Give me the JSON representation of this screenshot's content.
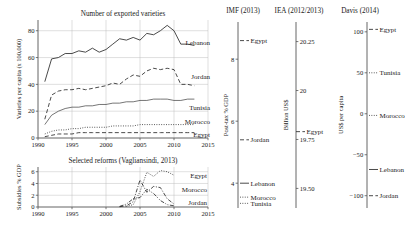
{
  "figure": {
    "panels_header": [
      "IMF (2013)",
      "IEA (2012/2013)",
      "Davis (2014)"
    ]
  },
  "chart_data": [
    {
      "id": "exported-varieties",
      "type": "line",
      "title": "Number of exported varieties",
      "xlabel": "",
      "ylabel": "Varieties per capita (x 100,000)",
      "xlim": [
        1990,
        2015
      ],
      "ylim": [
        0,
        88
      ],
      "xticks": [
        1990,
        1995,
        2000,
        2005,
        2010,
        2015
      ],
      "yticks": [
        0,
        20,
        40,
        60,
        80
      ],
      "grid": true,
      "legend_position": "right-inline",
      "series": [
        {
          "name": "Lebanon",
          "style": "solid",
          "x": [
            1991,
            1992,
            1993,
            1994,
            1995,
            1996,
            1997,
            1998,
            1999,
            2000,
            2001,
            2002,
            2003,
            2004,
            2005,
            2006,
            2007,
            2008,
            2009,
            2010,
            2011,
            2012,
            2013
          ],
          "values": [
            42,
            59,
            60,
            63,
            63,
            65,
            64,
            67,
            64,
            66,
            70,
            74,
            73,
            75,
            73,
            78,
            77,
            80,
            84,
            80,
            70,
            70,
            69
          ]
        },
        {
          "name": "Jordan",
          "style": "dashed",
          "x": [
            1991,
            1992,
            1993,
            1994,
            1995,
            1996,
            1997,
            1998,
            1999,
            2000,
            2001,
            2002,
            2003,
            2004,
            2005,
            2006,
            2007,
            2008,
            2009,
            2010,
            2011,
            2012,
            2013
          ],
          "values": [
            14,
            32,
            35,
            36,
            36,
            37,
            36,
            37,
            38,
            39,
            41,
            40,
            44,
            47,
            46,
            50,
            52,
            51,
            52,
            51,
            40,
            40,
            39
          ]
        },
        {
          "name": "Tunisia",
          "style": "thin-solid",
          "x": [
            1991,
            1992,
            1993,
            1994,
            1995,
            1996,
            1997,
            1998,
            1999,
            2000,
            2001,
            2002,
            2003,
            2004,
            2005,
            2006,
            2007,
            2008,
            2009,
            2010,
            2011,
            2012,
            2013
          ],
          "values": [
            10,
            17,
            20,
            22,
            23,
            23,
            24,
            24,
            25,
            25,
            26,
            26,
            27,
            27,
            28,
            28,
            29,
            29,
            29,
            28,
            28,
            29,
            29
          ]
        },
        {
          "name": "Morocco",
          "style": "dotted",
          "x": [
            1991,
            1992,
            1993,
            1994,
            1995,
            1996,
            1997,
            1998,
            1999,
            2000,
            2001,
            2002,
            2003,
            2004,
            2005,
            2006,
            2007,
            2008,
            2009,
            2010,
            2011,
            2012,
            2013
          ],
          "values": [
            3,
            5,
            6,
            6,
            7,
            7,
            8,
            8,
            8,
            8,
            9,
            9,
            9,
            9,
            10,
            10,
            10,
            10,
            10,
            10,
            10,
            10,
            10
          ]
        },
        {
          "name": "Egypt",
          "style": "dashed",
          "x": [
            1991,
            1992,
            1993,
            1994,
            1995,
            1996,
            1997,
            1998,
            1999,
            2000,
            2001,
            2002,
            2003,
            2004,
            2005,
            2006,
            2007,
            2008,
            2009,
            2010,
            2011,
            2012,
            2013
          ],
          "values": [
            1,
            2,
            3,
            3,
            3,
            4,
            4,
            4,
            4,
            4,
            4,
            4,
            4,
            4,
            4,
            4,
            4,
            4,
            4,
            4,
            4,
            4,
            4
          ]
        }
      ]
    },
    {
      "id": "selected-reforms",
      "type": "line",
      "title": "Selected reforms (Vagliansindi, 2013)",
      "xlabel": "",
      "ylabel": "Subsidies % GDP",
      "xlim": [
        1990,
        2015
      ],
      "ylim": [
        0,
        6.8
      ],
      "xticks": [
        1990,
        1995,
        2000,
        2005,
        2010,
        2015
      ],
      "yticks": [
        0,
        2,
        4,
        6
      ],
      "grid": true,
      "legend_position": "right-inline",
      "series": [
        {
          "name": "Egypt",
          "style": "dotted",
          "x": [
            2003,
            2004,
            2005,
            2006,
            2007,
            2008,
            2009,
            2010
          ],
          "values": [
            0.1,
            0.4,
            2.6,
            5.9,
            5.2,
            6.2,
            6.0,
            5.4
          ]
        },
        {
          "name": "Morocco",
          "style": "dash-dot",
          "x": [
            2002,
            2003,
            2004,
            2005,
            2006,
            2007,
            2008,
            2009,
            2010
          ],
          "values": [
            0.05,
            0.2,
            0.9,
            4.6,
            2.5,
            3.5,
            3.3,
            1.4,
            0.5
          ]
        },
        {
          "name": "Jordan",
          "style": "dash-dot-dot",
          "x": [
            2002,
            2003,
            2004,
            2005,
            2006,
            2007,
            2008,
            2009,
            2010
          ],
          "values": [
            0.1,
            0.5,
            1.4,
            1.6,
            3.0,
            2.3,
            1.1,
            0.4,
            0.2
          ]
        }
      ]
    },
    {
      "id": "imf-2013",
      "type": "scatter",
      "title": "IMF (2013)",
      "ylabel": "Post-tax % GDP",
      "ylim": [
        3.2,
        9.2
      ],
      "yticks": [
        4,
        6,
        8
      ],
      "points": [
        {
          "name": "Egypt",
          "value": 8.6,
          "style": "dashed"
        },
        {
          "name": "Jordan",
          "value": 5.4,
          "style": "dashed"
        },
        {
          "name": "Lebanon",
          "value": 4.0,
          "style": "solid"
        },
        {
          "name": "Morocco",
          "value": 3.55,
          "style": "dotted"
        },
        {
          "name": "Tunisia",
          "value": 3.35,
          "style": "dotted"
        }
      ]
    },
    {
      "id": "iea-2012-2013",
      "type": "scatter",
      "title": "IEA (2012/2013)",
      "ylabel": "Billion US$",
      "ylim": [
        19.4,
        20.35
      ],
      "yticks": [
        19.5,
        19.75,
        20.0,
        20.25
      ],
      "points": [
        {
          "name": "Egypt",
          "value": 19.79,
          "style": "dashed"
        }
      ]
    },
    {
      "id": "davis-2014",
      "type": "scatter",
      "title": "Davis (2014)",
      "ylabel": "US$ per capita",
      "ylim": [
        -115,
        112
      ],
      "yticks": [
        100,
        50,
        0,
        -50,
        -100
      ],
      "points": [
        {
          "name": "Egypt",
          "value": 103,
          "style": "dashed"
        },
        {
          "name": "Tunisia",
          "value": 50,
          "style": "dotted"
        },
        {
          "name": "Morocco",
          "value": -2,
          "style": "dotted"
        },
        {
          "name": "Lebanon",
          "value": -68,
          "style": "solid"
        },
        {
          "name": "Jordan",
          "value": -100,
          "style": "dashed"
        }
      ]
    }
  ]
}
